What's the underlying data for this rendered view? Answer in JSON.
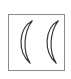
{
  "glyph": {
    "name": "double-open-parenthesis",
    "symbol": "((",
    "stroke_color": "#333333",
    "border_color": "#8a8a8a",
    "background": "#ffffff"
  }
}
